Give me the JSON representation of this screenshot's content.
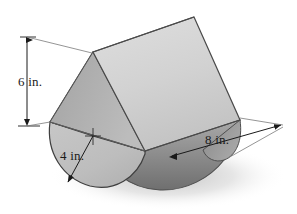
{
  "figure": {
    "solid_name": "prism-on-half-cylinder",
    "background_color": "#ffffff",
    "shadow_color": "#cfcfcf",
    "outline_color": "#4a4a4a",
    "faces": {
      "prism_top_right": "#d4d4d4",
      "prism_left": "#adadad",
      "front_semicircle": "#bdbdbd",
      "half_cylinder_under": "#8e8e8e",
      "cylinder_right_end": "#9a9a9a"
    },
    "dimensions": [
      {
        "id": "height",
        "label": "6 in.",
        "value": 6,
        "unit": "in.",
        "describes": "overall height from base diameter line to prism apex",
        "leader": "vertical-double-arrow-left"
      },
      {
        "id": "radius",
        "label": "4 in.",
        "value": 4,
        "unit": "in.",
        "describes": "radius of semicircular cross-section",
        "leader": "arrow-from-center-to-arc"
      },
      {
        "id": "length",
        "label": "8 in.",
        "value": 8,
        "unit": "in.",
        "describes": "length of the solid along the prism axis",
        "leader": "horizontal-double-arrow-right"
      }
    ]
  }
}
